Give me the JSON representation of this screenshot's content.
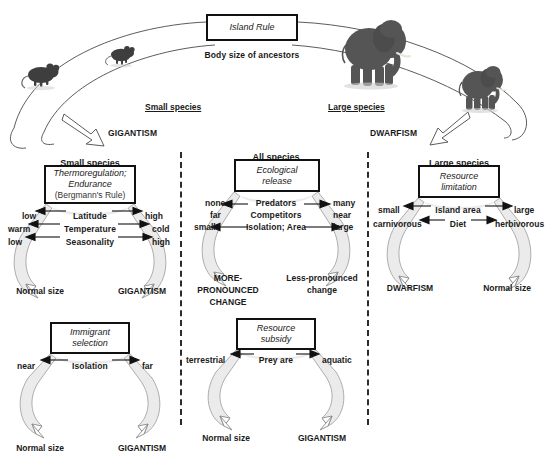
{
  "figure": {
    "title": "Island Rule",
    "subtitle": "Body size of ancestors",
    "caption": ""
  },
  "banner": {
    "small_label": "Small species",
    "large_label": "Large species",
    "left_outcome": "GIGANTISM",
    "right_outcome": "DWARFISM",
    "icons": {
      "small_1": "mouse-icon",
      "small_2": "mouse-icon",
      "large_1": "elephant-icon",
      "large_2": "elephant-small-icon"
    }
  },
  "panels": [
    {
      "id": "small-species",
      "header": "Small species",
      "driver_lines": [
        "Thermoregulation;",
        "Endurance"
      ],
      "driver_note": "(Bergmann's Rule)",
      "rows": [
        {
          "left": "low",
          "factor": "Latitude",
          "right": "high"
        },
        {
          "left": "warm",
          "factor": "Temperature",
          "right": "cold"
        },
        {
          "left": "low",
          "factor": "Seasonality",
          "right": "high"
        }
      ],
      "outcome_left": "Normal size",
      "outcome_right": "GIGANTISM"
    },
    {
      "id": "all-species",
      "header": "All species",
      "driver_lines": [
        "Ecological",
        "release"
      ],
      "driver_note": "",
      "rows": [
        {
          "left": "none\nfar",
          "factor": "Predators\nCompetitors",
          "right": "many\nnear"
        },
        {
          "left": "small",
          "factor": "Isolation; Area",
          "right": "large"
        }
      ],
      "left_stack": [
        "none",
        "far",
        "small"
      ],
      "right_stack": [
        "many",
        "near",
        "large"
      ],
      "factor_stack": [
        "Predators",
        "Competitors",
        "Isolation; Area"
      ],
      "outcome_left": "MORE-PRONOUNCED CHANGE",
      "outcome_left_lines": [
        "MORE-",
        "PRONOUNCED",
        "CHANGE"
      ],
      "outcome_right": "Less-pronounced change",
      "outcome_right_lines": [
        "Less-pronounced",
        "change"
      ]
    },
    {
      "id": "large-species",
      "header": "Large species",
      "driver_lines": [
        "Resource",
        "limitation"
      ],
      "driver_note": "",
      "rows": [
        {
          "left": "small",
          "factor": "Island area",
          "right": "large"
        },
        {
          "left": "carnivorous",
          "factor": "Diet",
          "right": "herbivorous"
        }
      ],
      "outcome_left": "DWARFISM",
      "outcome_right": "Normal size"
    },
    {
      "id": "immigrant-selection",
      "header": "",
      "driver_lines": [
        "Immigrant",
        "selection"
      ],
      "driver_note": "",
      "rows": [
        {
          "left": "near",
          "factor": "Isolation",
          "right": "far"
        }
      ],
      "outcome_left": "Normal size",
      "outcome_right": "GIGANTISM"
    },
    {
      "id": "resource-subsidy",
      "header": "",
      "driver_lines": [
        "Resource",
        "subsidy"
      ],
      "driver_note": "",
      "rows": [
        {
          "left": "terrestrial",
          "factor": "Prey are",
          "right": "aquatic"
        }
      ],
      "outcome_left": "Normal size",
      "outcome_right": "GIGANTISM"
    }
  ],
  "colors": {
    "ink": "#1a1a1a",
    "box_border": "#111111",
    "funnel_fill": "#ebebeb",
    "funnel_stroke": "#8a8a8a",
    "divider": "#2b2b2b",
    "background": "#ffffff"
  }
}
